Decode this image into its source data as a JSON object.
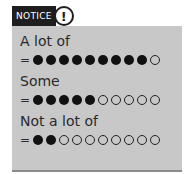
{
  "notice": {
    "label": "NOTICE",
    "icon": "exclamation-circle-icon",
    "icon_glyph": "!"
  },
  "rows": [
    {
      "label": "A lot of",
      "equals": "=",
      "filled": 9,
      "total": 10
    },
    {
      "label": "Some",
      "equals": "=",
      "filled": 5,
      "total": 10
    },
    {
      "label": "Not a lot of",
      "equals": "=",
      "filled": 2,
      "total": 10
    }
  ],
  "colors": {
    "panel": "#c8c8c8",
    "header": "#1e1e1e",
    "dot": "#111111"
  }
}
